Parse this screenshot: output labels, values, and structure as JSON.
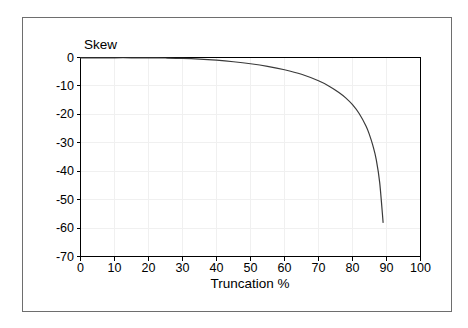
{
  "figure": {
    "background_color": "#ffffff",
    "frame_color": "#6e6e6e",
    "axis_color": "#000000",
    "grid_color": "#f0f0f0",
    "curve_color": "#3a3a3a"
  },
  "chart_data": {
    "type": "line",
    "title": "",
    "subtitle": "",
    "xlabel": "Truncation %",
    "ylabel": "Skew",
    "xlim": [
      0,
      100
    ],
    "ylim": [
      -70,
      0
    ],
    "grid": true,
    "legend": null,
    "legend_position": "none",
    "xticks": [
      0,
      10,
      20,
      30,
      40,
      50,
      60,
      70,
      80,
      90,
      100
    ],
    "xtick_labels": [
      "0",
      "10",
      "20",
      "30",
      "40",
      "50",
      "60",
      "70",
      "80",
      "90",
      "100"
    ],
    "yticks": [
      0,
      -10,
      -20,
      -30,
      -40,
      -50,
      -60,
      -70
    ],
    "ytick_labels": [
      "0",
      "-10",
      "-20",
      "-30",
      "-40",
      "-50",
      "-60",
      "-70"
    ],
    "series": [
      {
        "name": "Skew",
        "x": [
          0,
          5,
          10,
          15,
          20,
          25,
          30,
          35,
          40,
          45,
          50,
          55,
          60,
          65,
          70,
          73,
          76,
          78,
          80,
          82,
          84,
          85,
          86,
          87,
          88,
          89
        ],
        "y": [
          -0.15,
          -0.12,
          -0.1,
          -0.1,
          -0.12,
          -0.18,
          -0.3,
          -0.55,
          -0.95,
          -1.5,
          -2.2,
          -3.1,
          -4.3,
          -5.9,
          -8.2,
          -10.0,
          -12.3,
          -14.2,
          -16.6,
          -19.8,
          -24.2,
          -27.2,
          -31.0,
          -36.0,
          -44.0,
          -58.0
        ]
      }
    ],
    "annotations": []
  },
  "axis_titles": {
    "y": "Skew",
    "x": "Truncation %"
  }
}
